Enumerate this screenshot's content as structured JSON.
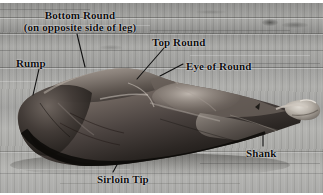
{
  "figure": {
    "background_description": "weathered gray wooden planks",
    "palette": {
      "wood_light": "#b4b4b1",
      "wood_mid": "#9a9a98",
      "wood_dark": "#8d8d8b",
      "meat_light": "#a39a93",
      "meat_mid": "#6e645e",
      "meat_dark": "#2e2925",
      "meat_shadow": "#161412",
      "label_text": "#0d0d0d",
      "leader_line": "#101010",
      "page_background": "#ffffff"
    }
  },
  "labels": [
    {
      "id": "bottom-round",
      "line1": "Bottom Round",
      "line2": "(on opposite side of leg)",
      "x": 14,
      "y": 9
    },
    {
      "id": "top-round",
      "line1": "Top Round",
      "line2": "",
      "x": 152,
      "y": 36
    },
    {
      "id": "rump",
      "line1": "Rump",
      "line2": "",
      "x": 16,
      "y": 57
    },
    {
      "id": "eye-of-round",
      "line1": "Eye of Round",
      "line2": "",
      "x": 186,
      "y": 60
    },
    {
      "id": "sirloin-tip",
      "line1": "Sirloin Tip",
      "line2": "",
      "x": 97,
      "y": 173
    },
    {
      "id": "shank",
      "line1": "Shank",
      "line2": "",
      "x": 246,
      "y": 147
    }
  ]
}
